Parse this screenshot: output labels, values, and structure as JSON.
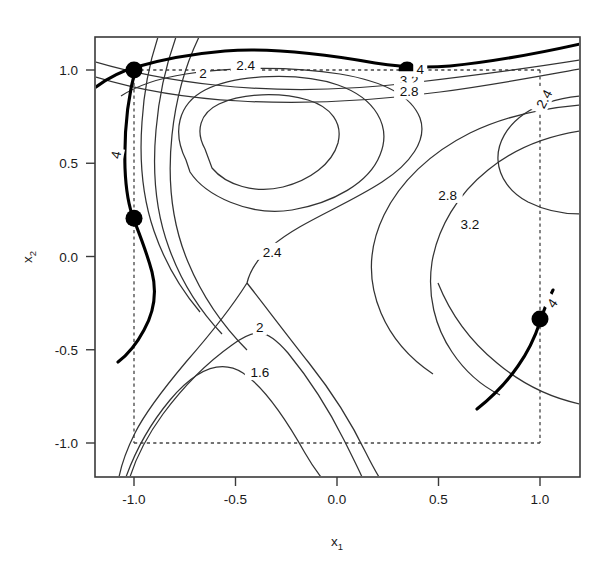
{
  "chart_data": {
    "type": "line",
    "subtype": "contour",
    "title": "",
    "xlabel": "x_1",
    "ylabel": "x_2",
    "xlim": [
      -1.18,
      1.2
    ],
    "ylim": [
      -1.2,
      1.17
    ],
    "xticks": [
      -1.0,
      -0.5,
      0.0,
      0.5,
      1.0
    ],
    "xticklabels": [
      "-1.0",
      "-0.5",
      "0.0",
      "0.5",
      "1.0"
    ],
    "yticks": [
      1.0,
      0.5,
      0.0,
      -0.5,
      -1.0
    ],
    "yticklabels": [
      "1.0",
      "0.5",
      "0.0",
      "-0.5",
      "-1.0"
    ],
    "grid": false,
    "legend": null,
    "contour_levels": [
      1.6,
      2,
      2.4,
      2.8,
      3.2,
      4
    ],
    "highlighted_level": 4,
    "contour_labels": [
      {
        "text": "2",
        "x": -0.66,
        "y": 0.985,
        "rotation": 0
      },
      {
        "text": "2.4",
        "x": -0.45,
        "y": 1.025,
        "rotation": 0
      },
      {
        "text": "3.2",
        "x": 0.355,
        "y": 0.945,
        "rotation": 0
      },
      {
        "text": "2.8",
        "x": 0.355,
        "y": 0.885,
        "rotation": 0
      },
      {
        "text": "4",
        "x": 0.41,
        "y": 1.005,
        "rotation": 0
      },
      {
        "text": "4",
        "x": -1.09,
        "y": 0.545,
        "rotation": -78
      },
      {
        "text": "4",
        "x": 1.06,
        "y": -0.25,
        "rotation": -55
      },
      {
        "text": "2.4",
        "x": 1.02,
        "y": 0.845,
        "rotation": -62
      },
      {
        "text": "2.8",
        "x": 0.545,
        "y": 0.33,
        "rotation": 0
      },
      {
        "text": "3.2",
        "x": 0.655,
        "y": 0.175,
        "rotation": 0
      },
      {
        "text": "2.4",
        "x": -0.32,
        "y": 0.025,
        "rotation": 0
      },
      {
        "text": "2",
        "x": -0.38,
        "y": -0.38,
        "rotation": 0
      },
      {
        "text": "1.6",
        "x": -0.38,
        "y": -0.62,
        "rotation": 0
      }
    ],
    "points": [
      {
        "x": -1.0,
        "y": 1.0,
        "label": "optimum-point"
      },
      {
        "x": 0.345,
        "y": 1.0,
        "label": "optimum-point"
      },
      {
        "x": -1.0,
        "y": 0.205,
        "label": "optimum-point"
      },
      {
        "x": 1.0,
        "y": -0.335,
        "label": "optimum-point"
      }
    ],
    "dashed_box": {
      "x": [
        -1.0,
        1.0
      ],
      "y": [
        -1.0,
        1.0
      ]
    },
    "colors": {
      "contour": "#333333",
      "highlight": "#000000",
      "point": "#000000",
      "frame": "#3a3a3a",
      "dashed": "#444444"
    }
  }
}
